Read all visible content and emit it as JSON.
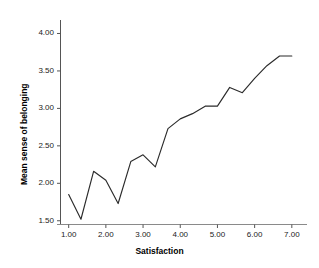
{
  "chart_data": {
    "type": "line",
    "title": "",
    "xlabel": "Satisfaction",
    "ylabel": "Mean sense of belonging",
    "xlim": [
      0.78,
      7.22
    ],
    "ylim": [
      1.45,
      4.18
    ],
    "grid": false,
    "legend": null,
    "line_color": "#2b2b2b",
    "background_color": "#ffffff",
    "xticks": [
      "1.00",
      "2.00",
      "3.00",
      "4.00",
      "5.00",
      "6.00",
      "7.00"
    ],
    "xtick_values": [
      1.0,
      2.0,
      3.0,
      4.0,
      5.0,
      6.0,
      7.0
    ],
    "yticks": [
      "1.50",
      "2.00",
      "2.50",
      "3.00",
      "3.50",
      "4.00"
    ],
    "ytick_values": [
      1.5,
      2.0,
      2.5,
      3.0,
      3.5,
      4.0
    ],
    "x": [
      1.0,
      1.33,
      1.67,
      2.0,
      2.33,
      2.67,
      3.0,
      3.33,
      3.67,
      4.0,
      4.33,
      4.67,
      5.0,
      5.33,
      5.67,
      6.0,
      6.33,
      6.67,
      7.0
    ],
    "values": [
      1.85,
      1.52,
      2.16,
      2.04,
      1.73,
      2.29,
      2.38,
      2.22,
      2.73,
      2.86,
      2.93,
      3.03,
      3.03,
      3.28,
      3.21,
      3.4,
      3.57,
      3.7,
      3.7
    ],
    "series": [
      {
        "name": "Mean sense of belonging",
        "values": [
          1.85,
          1.52,
          2.16,
          2.04,
          1.73,
          2.29,
          2.38,
          2.22,
          2.73,
          2.86,
          2.93,
          3.03,
          3.03,
          3.28,
          3.21,
          3.4,
          3.57,
          3.7,
          3.7
        ]
      }
    ]
  }
}
